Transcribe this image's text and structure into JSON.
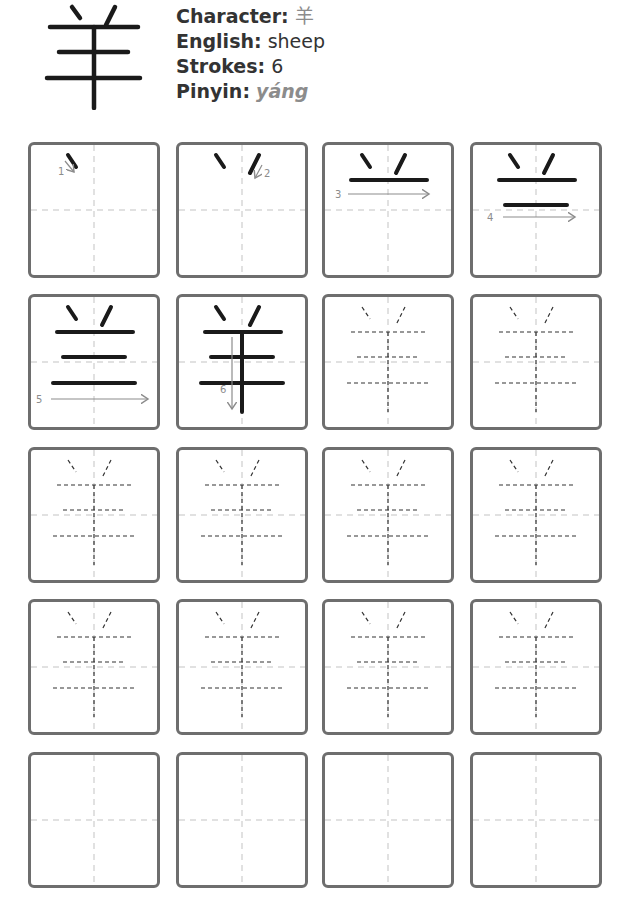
{
  "header": {
    "character_glyph": "羊",
    "fields": [
      {
        "label": "Character",
        "value": "羊"
      },
      {
        "label": "English",
        "value": "sheep"
      },
      {
        "label": "Strokes",
        "value": "6"
      },
      {
        "label": "Pinyin",
        "value": "yáng"
      }
    ]
  },
  "colors": {
    "stroke": "#1a1a1a",
    "guide": "#d8d8d8",
    "border": "#6e6e6e",
    "arrow": "#8c8c8c",
    "trace": "#333333",
    "muted_text": "#8c8c8c"
  },
  "stroke_order": [
    {
      "step": 1,
      "label": "1"
    },
    {
      "step": 2,
      "label": "2"
    },
    {
      "step": 3,
      "label": "3"
    },
    {
      "step": 4,
      "label": "4"
    },
    {
      "step": 5,
      "label": "5"
    },
    {
      "step": 6,
      "label": "6"
    }
  ],
  "grid": {
    "rows": 5,
    "columns": 4,
    "stroke_order_cells": 6,
    "trace_cells": 10,
    "blank_cells": 4
  }
}
